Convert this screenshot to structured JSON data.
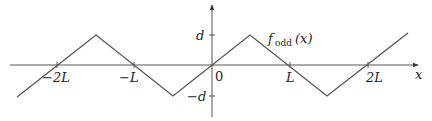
{
  "diagram": {
    "function_label": {
      "main": "f",
      "subscript": "odd",
      "arg": "(x)"
    },
    "axes": {
      "x_label": "x",
      "y_ticks": [
        {
          "label": "d"
        },
        {
          "label": "−d"
        }
      ],
      "x_ticks": [
        {
          "label": "−2L"
        },
        {
          "label": "−L"
        },
        {
          "label": "0"
        },
        {
          "label": "L"
        },
        {
          "label": "2L"
        }
      ]
    },
    "colors": {
      "axis": "#555555",
      "curve": "#555555",
      "text": "#222222"
    }
  }
}
